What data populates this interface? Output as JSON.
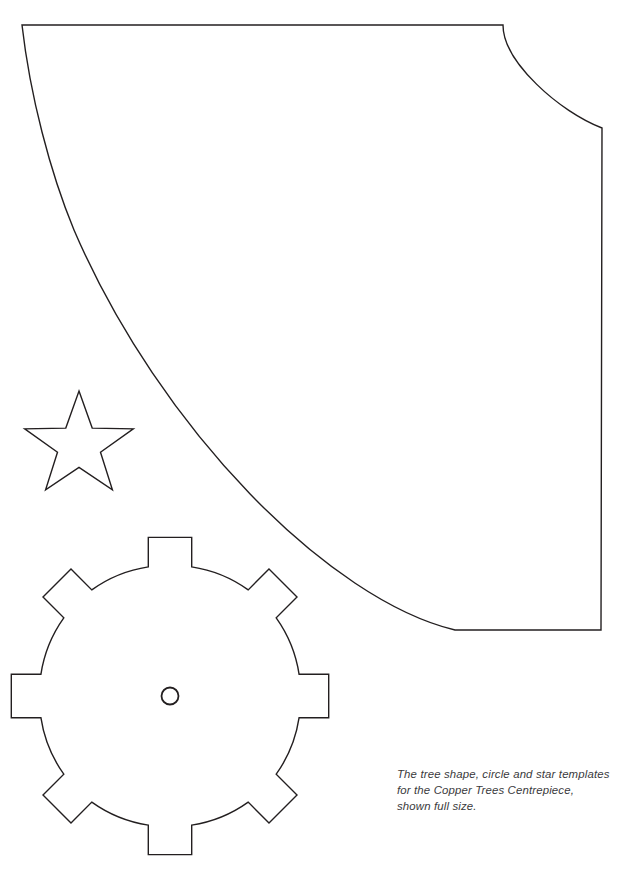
{
  "page": {
    "width": 627,
    "height": 876,
    "background_color": "#ffffff",
    "ink_color": "#231f20",
    "caption_color": "#3a3a3c"
  },
  "caption": {
    "name": "template-caption",
    "full_text": "The tree shape, circle and star templates for the Copper Trees Centrepiece, shown full size.",
    "lines": [
      "The tree shape, circle and star templates",
      "for the Copper Trees Centrepiece,",
      "shown full size."
    ],
    "style": "italic",
    "project_name": "Copper Trees Centrepiece",
    "scale_note": "shown full size"
  },
  "shapes": [
    {
      "id": "tree-cone-template",
      "label": "tree shape",
      "description": "Large quarter-cone template with straight top edge, straight right edge, concave sweeping curve from upper-left to lower-right, and a rounded shoulder at the top right.",
      "bounds": {
        "x": 16,
        "y": 22,
        "width": 588,
        "height": 612
      },
      "stroke": "#231f20",
      "fill": "#ffffff"
    },
    {
      "id": "star-template",
      "label": "star",
      "description": "Five-pointed star outline.",
      "points": 5,
      "center": {
        "x": 79,
        "y": 446
      },
      "outer_radius": 55,
      "inner_radius": 23,
      "rotation_deg": -90,
      "stroke": "#231f20",
      "fill": "#ffffff"
    },
    {
      "id": "circle-cog-template",
      "label": "circle",
      "description": "Circular disc template with eight square tabs around the rim and a small central hole.",
      "center": {
        "x": 170,
        "y": 696
      },
      "outer_radius": 160,
      "body_radius": 131,
      "teeth": 8,
      "tooth_half_angle_deg": 9.5,
      "center_hole_radius": 8.5,
      "stroke": "#231f20",
      "fill": "#ffffff"
    }
  ]
}
